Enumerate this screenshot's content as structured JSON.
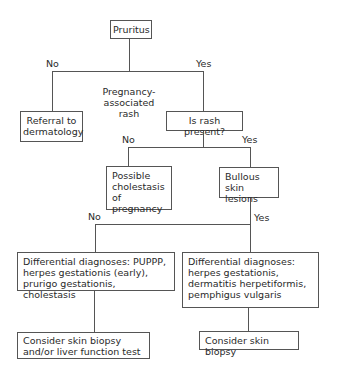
{
  "nodes": {
    "pruritus": "Pruritus",
    "referral": "Referral to dermatology",
    "pregnancy_rash_note": "Pregnancy-associated rash",
    "rash_present": "Is rash present?",
    "cholestasis": "Possible cholestasis of pregnancy",
    "bullous": "Bullous skin lesions",
    "diff_left": "Differential diagnoses: PUPPP, herpes gestationis (early), prurigo gestationis, cholestasis",
    "diff_right": "Differential diagnoses: herpes gestationis, dermatitis herpetiformis, pemphigus vulgaris",
    "consider_left": "Consider skin biopsy and/or liver function test",
    "consider_right": "Consider skin biopsy"
  },
  "edges": {
    "pruritus_no": "No",
    "pruritus_yes": "Yes",
    "rash_no": "No",
    "rash_yes": "Yes",
    "bullous_no": "No",
    "bullous_yes": "Yes"
  }
}
